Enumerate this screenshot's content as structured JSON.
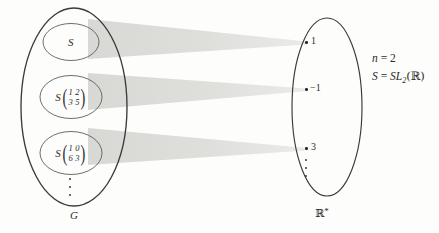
{
  "figure": {
    "type": "set-mapping-diagram",
    "background_color": "#fdfdfc",
    "ink_color": "#2b2b2b",
    "band_color": "#d9d9d6"
  },
  "left_set": {
    "name": "domain-set",
    "label": "G",
    "label_description": "group G equals GL sub 2 of R",
    "items": [
      {
        "id": "coset-S",
        "prefix": "S",
        "has_matrix": false,
        "matrix": null
      },
      {
        "id": "coset-A",
        "prefix": "S",
        "has_matrix": true,
        "matrix": [
          "1",
          "2",
          "3",
          "5"
        ]
      },
      {
        "id": "coset-B",
        "prefix": "S",
        "has_matrix": true,
        "matrix": [
          "1",
          "0",
          "6",
          "3"
        ]
      }
    ],
    "ellipsis": "⋮"
  },
  "right_set": {
    "name": "codomain-set",
    "label": "ℝ",
    "label_superscript": "*",
    "elements": [
      {
        "id": "elem-1",
        "value": "1"
      },
      {
        "id": "elem-neg1",
        "value": "−1"
      },
      {
        "id": "elem-3",
        "value": "3"
      }
    ],
    "ellipsis": "⋮"
  },
  "mappings": [
    {
      "from": "coset-S",
      "to": "elem-1"
    },
    {
      "from": "coset-A",
      "to": "elem-neg1"
    },
    {
      "from": "coset-B",
      "to": "elem-3"
    }
  ],
  "annotation": {
    "line1_lhs": "n",
    "line1_eq": "=",
    "line1_rhs": "2",
    "line2_lhs": "S",
    "line2_eq": "=",
    "line2_rhs_name": "SL",
    "line2_rhs_sub": "2",
    "line2_rhs_arg": "(ℝ)"
  }
}
